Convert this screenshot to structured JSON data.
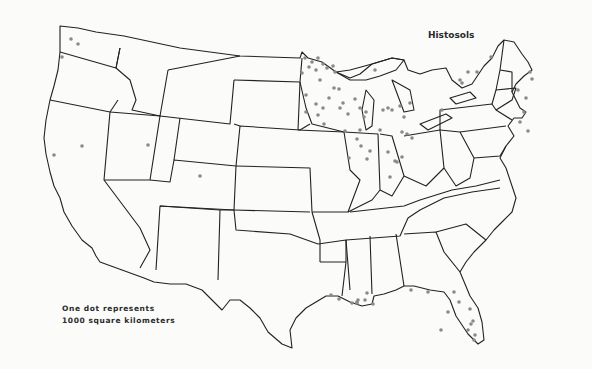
{
  "title": "Histosols",
  "legend": {
    "line1": "One dot represents",
    "line2": "1000 square kilometers"
  },
  "colors": {
    "background": "#fbfbfa",
    "boundary": "#222222",
    "dot": "#8a8a8a"
  },
  "dots": [
    [
      71,
      39
    ],
    [
      78,
      44
    ],
    [
      62,
      57
    ],
    [
      82,
      146
    ],
    [
      54,
      155
    ],
    [
      148,
      145
    ],
    [
      200,
      176
    ],
    [
      305,
      58
    ],
    [
      312,
      62
    ],
    [
      318,
      58
    ],
    [
      323,
      64
    ],
    [
      309,
      67
    ],
    [
      316,
      70
    ],
    [
      327,
      68
    ],
    [
      333,
      66
    ],
    [
      335,
      72
    ],
    [
      302,
      73
    ],
    [
      320,
      80
    ],
    [
      334,
      88
    ],
    [
      329,
      98
    ],
    [
      316,
      104
    ],
    [
      306,
      95
    ],
    [
      323,
      108
    ],
    [
      318,
      115
    ],
    [
      306,
      112
    ],
    [
      324,
      124
    ],
    [
      339,
      89
    ],
    [
      343,
      103
    ],
    [
      340,
      108
    ],
    [
      355,
      99
    ],
    [
      348,
      114
    ],
    [
      360,
      108
    ],
    [
      366,
      112
    ],
    [
      364,
      117
    ],
    [
      360,
      130
    ],
    [
      357,
      139
    ],
    [
      361,
      146
    ],
    [
      370,
      151
    ],
    [
      367,
      159
    ],
    [
      349,
      158
    ],
    [
      345,
      131
    ],
    [
      383,
      110
    ],
    [
      388,
      108
    ],
    [
      400,
      106
    ],
    [
      410,
      103
    ],
    [
      404,
      117
    ],
    [
      380,
      130
    ],
    [
      402,
      132
    ],
    [
      402,
      157
    ],
    [
      395,
      161
    ],
    [
      390,
      177
    ],
    [
      397,
      162
    ],
    [
      407,
      134
    ],
    [
      412,
      138
    ],
    [
      392,
      110
    ],
    [
      375,
      70
    ],
    [
      388,
      152
    ],
    [
      442,
      110
    ],
    [
      468,
      72
    ],
    [
      460,
      80
    ],
    [
      491,
      57
    ],
    [
      477,
      72
    ],
    [
      530,
      72
    ],
    [
      532,
      79
    ],
    [
      462,
      83
    ],
    [
      528,
      131
    ],
    [
      524,
      112
    ],
    [
      520,
      122
    ],
    [
      526,
      98
    ],
    [
      518,
      90
    ],
    [
      331,
      295
    ],
    [
      339,
      299
    ],
    [
      352,
      303
    ],
    [
      358,
      300
    ],
    [
      357,
      303
    ],
    [
      365,
      300
    ],
    [
      357,
      302
    ],
    [
      367,
      293
    ],
    [
      411,
      290
    ],
    [
      428,
      292
    ],
    [
      454,
      292
    ],
    [
      459,
      302
    ],
    [
      448,
      312
    ],
    [
      470,
      309
    ],
    [
      473,
      321
    ],
    [
      471,
      324
    ],
    [
      468,
      330
    ],
    [
      475,
      335
    ],
    [
      474,
      340
    ],
    [
      441,
      330
    ],
    [
      373,
      304
    ]
  ]
}
